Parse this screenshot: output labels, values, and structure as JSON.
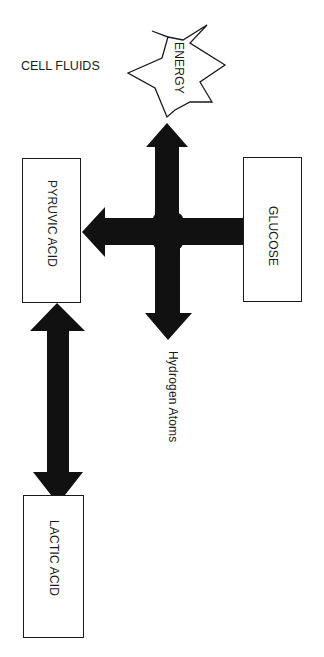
{
  "diagram": {
    "title_label": "CELL FLUIDS",
    "nodes": {
      "energy": {
        "label": "ENERGY",
        "shape": "starburst"
      },
      "glucose": {
        "label": "GLUCOSE",
        "shape": "rectangle"
      },
      "pyruvic_acid": {
        "label": "PYRUVIC ACID",
        "shape": "rectangle"
      },
      "lactic_acid": {
        "label": "LACTIC ACID",
        "shape": "rectangle"
      },
      "hydrogen_atoms": {
        "label": "Hydrogen Atoms",
        "shape": "text"
      }
    },
    "edges": [
      {
        "from": "glucose",
        "to": "pyruvic_acid",
        "type": "single-arrow"
      },
      {
        "from": "glucose-pathway",
        "to": "energy",
        "type": "arrow-up"
      },
      {
        "from": "glucose-pathway",
        "to": "hydrogen_atoms",
        "type": "arrow-down"
      },
      {
        "from": "pyruvic_acid",
        "to": "lactic_acid",
        "type": "double-arrow"
      }
    ],
    "colors": {
      "ink": "#1a1a1a",
      "background": "#ffffff"
    }
  }
}
